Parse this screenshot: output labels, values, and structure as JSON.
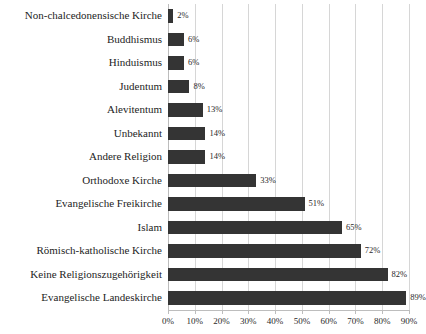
{
  "chart_data": {
    "type": "bar",
    "orientation": "horizontal",
    "title": "",
    "subtitle": "",
    "xlabel": "",
    "ylabel": "",
    "xlim": [
      0,
      90
    ],
    "grid": true,
    "legend": false,
    "value_suffix": "%",
    "bar_color": "#343434",
    "gridline_color": "#d6d6d6",
    "background_color": "#ffffff",
    "xticks": [
      0,
      10,
      20,
      30,
      40,
      50,
      60,
      70,
      80,
      90
    ],
    "xtick_labels": [
      "0%",
      "10%",
      "20%",
      "30%",
      "40%",
      "50%",
      "60%",
      "70%",
      "80%",
      "90%"
    ],
    "categories": [
      "Non-chalcedonensische Kirche",
      "Buddhismus",
      "Hinduismus",
      "Judentum",
      "Alevitentum",
      "Unbekannt",
      "Andere Religion",
      "Orthodoxe Kirche",
      "Evangelische Freikirche",
      "Islam",
      "Römisch-katholische Kirche",
      "Keine Religionszugehörigkeit",
      "Evangelische Landeskirche"
    ],
    "values": [
      2,
      6,
      6,
      8,
      13,
      14,
      14,
      33,
      51,
      65,
      72,
      82,
      89
    ],
    "data_labels": [
      "2%",
      "6%",
      "6%",
      "8%",
      "13%",
      "14%",
      "14%",
      "33%",
      "51%",
      "65%",
      "72%",
      "82%",
      "89%"
    ]
  }
}
